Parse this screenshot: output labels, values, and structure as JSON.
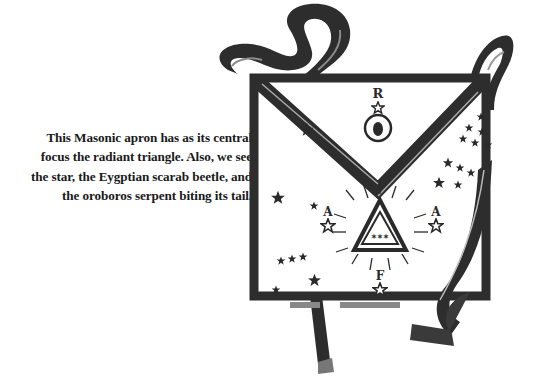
{
  "caption": {
    "lines": [
      "This Masonic apron has as its central",
      "focus the radiant triangle. Also, we see",
      "the star, the Eygptian scarab beetle, and",
      "the oroboros serpent biting its tail."
    ]
  },
  "illustration": {
    "subject": "Masonic apron",
    "emblem_letters": {
      "top": "R",
      "left": "A",
      "right": "A",
      "bottom": "F"
    },
    "triangle_inscription": "✶✶✶",
    "colors": {
      "ink": "#2a2a2a",
      "paper": "#ffffff",
      "ribbon_highlight": "#9a9a9a"
    }
  }
}
